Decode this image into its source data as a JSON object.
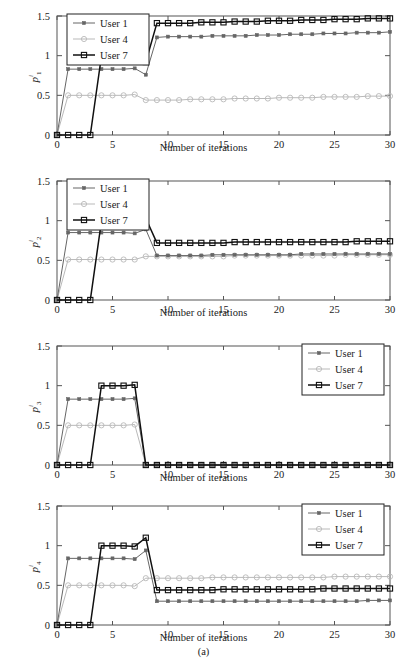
{
  "figure": {
    "caption": "(a)",
    "xlabel": "Number of iterations",
    "legend_labels": [
      "User 1",
      "User 4",
      "User 7"
    ],
    "colors": {
      "user1": "#666666",
      "user4": "#b9b9b9",
      "user7": "#101010",
      "axis": "#555555",
      "background": "#ffffff"
    },
    "markers": {
      "user1": "filled-star",
      "user4": "open-circle",
      "user7": "open-square"
    }
  },
  "chart_data": [
    {
      "type": "line",
      "title": "",
      "panel_id": "p1",
      "ylabel": "p^i_1",
      "ylabel_base": "p",
      "ylabel_sup": "i",
      "ylabel_sub": "1",
      "xlabel": "Number of iterations",
      "xlim": [
        0,
        30
      ],
      "ylim": [
        0,
        1.5
      ],
      "xticks": [
        0,
        5,
        10,
        15,
        20,
        25,
        30
      ],
      "yticks": [
        0,
        0.5,
        1,
        1.5
      ],
      "grid": false,
      "legend_position": "top-left",
      "x": [
        0,
        1,
        2,
        3,
        4,
        5,
        6,
        7,
        8,
        9,
        10,
        11,
        12,
        13,
        14,
        15,
        16,
        17,
        18,
        19,
        20,
        21,
        22,
        23,
        24,
        25,
        26,
        27,
        28,
        29,
        30
      ],
      "series": [
        {
          "name": "User 1",
          "marker": "filled-star",
          "color": "#666666",
          "values": [
            0,
            0.83,
            0.83,
            0.83,
            0.83,
            0.83,
            0.83,
            0.84,
            0.76,
            1.23,
            1.24,
            1.24,
            1.24,
            1.24,
            1.25,
            1.25,
            1.25,
            1.25,
            1.26,
            1.26,
            1.26,
            1.27,
            1.27,
            1.27,
            1.28,
            1.28,
            1.28,
            1.29,
            1.29,
            1.29,
            1.3
          ]
        },
        {
          "name": "User 4",
          "marker": "open-circle",
          "color": "#b9b9b9",
          "values": [
            0,
            0.5,
            0.5,
            0.5,
            0.5,
            0.5,
            0.5,
            0.51,
            0.44,
            0.44,
            0.44,
            0.44,
            0.45,
            0.45,
            0.45,
            0.45,
            0.46,
            0.46,
            0.46,
            0.46,
            0.47,
            0.47,
            0.47,
            0.47,
            0.48,
            0.48,
            0.48,
            0.48,
            0.49,
            0.49,
            0.49
          ]
        },
        {
          "name": "User 7",
          "marker": "open-square",
          "color": "#101010",
          "values": [
            0,
            0,
            0,
            0,
            0.99,
            0.99,
            0.99,
            1.0,
            0.92,
            1.41,
            1.41,
            1.41,
            1.41,
            1.42,
            1.42,
            1.42,
            1.43,
            1.43,
            1.43,
            1.44,
            1.44,
            1.44,
            1.45,
            1.45,
            1.45,
            1.46,
            1.46,
            1.46,
            1.47,
            1.47,
            1.47
          ]
        }
      ]
    },
    {
      "type": "line",
      "title": "",
      "panel_id": "p2",
      "ylabel": "p^i_2",
      "ylabel_base": "p",
      "ylabel_sup": "i",
      "ylabel_sub": "2",
      "xlabel": "Number of iterations",
      "xlim": [
        0,
        30
      ],
      "ylim": [
        0,
        1.5
      ],
      "xticks": [
        0,
        5,
        10,
        15,
        20,
        25,
        30
      ],
      "yticks": [
        0,
        0.5,
        1,
        1.5
      ],
      "grid": false,
      "legend_position": "top-left",
      "x": [
        0,
        1,
        2,
        3,
        4,
        5,
        6,
        7,
        8,
        9,
        10,
        11,
        12,
        13,
        14,
        15,
        16,
        17,
        18,
        19,
        20,
        21,
        22,
        23,
        24,
        25,
        26,
        27,
        28,
        29,
        30
      ],
      "series": [
        {
          "name": "User 1",
          "marker": "filled-star",
          "color": "#666666",
          "values": [
            0,
            0.85,
            0.85,
            0.85,
            0.85,
            0.85,
            0.85,
            0.84,
            0.89,
            0.56,
            0.56,
            0.56,
            0.56,
            0.56,
            0.57,
            0.57,
            0.57,
            0.57,
            0.57,
            0.57,
            0.57,
            0.57,
            0.58,
            0.58,
            0.58,
            0.58,
            0.58,
            0.58,
            0.58,
            0.58,
            0.58
          ]
        },
        {
          "name": "User 4",
          "marker": "open-circle",
          "color": "#b9b9b9",
          "values": [
            0,
            0.51,
            0.51,
            0.51,
            0.51,
            0.51,
            0.51,
            0.51,
            0.55,
            0.55,
            0.55,
            0.55,
            0.55,
            0.55,
            0.55,
            0.55,
            0.56,
            0.56,
            0.56,
            0.56,
            0.56,
            0.56,
            0.56,
            0.56,
            0.56,
            0.56,
            0.57,
            0.57,
            0.57,
            0.57,
            0.57
          ]
        },
        {
          "name": "User 7",
          "marker": "open-square",
          "color": "#101010",
          "values": [
            0,
            0,
            0,
            0,
            0.99,
            0.99,
            0.99,
            0.99,
            1.03,
            0.72,
            0.72,
            0.72,
            0.72,
            0.72,
            0.72,
            0.72,
            0.73,
            0.73,
            0.73,
            0.73,
            0.73,
            0.73,
            0.73,
            0.73,
            0.73,
            0.73,
            0.73,
            0.74,
            0.74,
            0.74,
            0.74
          ]
        }
      ]
    },
    {
      "type": "line",
      "title": "",
      "panel_id": "p3",
      "ylabel": "p^i_3",
      "ylabel_base": "p",
      "ylabel_sup": "i",
      "ylabel_sub": "3",
      "xlabel": "Number of iterations",
      "xlim": [
        0,
        30
      ],
      "ylim": [
        0,
        1.5
      ],
      "xticks": [
        0,
        5,
        10,
        15,
        20,
        25,
        30
      ],
      "yticks": [
        0,
        0.5,
        1,
        1.5
      ],
      "grid": false,
      "legend_position": "top-right",
      "x": [
        0,
        1,
        2,
        3,
        4,
        5,
        6,
        7,
        8,
        9,
        10,
        11,
        12,
        13,
        14,
        15,
        16,
        17,
        18,
        19,
        20,
        21,
        22,
        23,
        24,
        25,
        26,
        27,
        28,
        29,
        30
      ],
      "series": [
        {
          "name": "User 1",
          "marker": "filled-star",
          "color": "#666666",
          "values": [
            0,
            0.83,
            0.83,
            0.83,
            0.83,
            0.83,
            0.83,
            0.84,
            0,
            0,
            0,
            0,
            0,
            0,
            0,
            0,
            0,
            0,
            0,
            0,
            0,
            0,
            0,
            0,
            0,
            0,
            0,
            0,
            0,
            0,
            0
          ]
        },
        {
          "name": "User 4",
          "marker": "open-circle",
          "color": "#b9b9b9",
          "values": [
            0,
            0.5,
            0.5,
            0.5,
            0.5,
            0.5,
            0.5,
            0.51,
            0,
            0,
            0,
            0,
            0,
            0,
            0,
            0,
            0,
            0,
            0,
            0,
            0,
            0,
            0,
            0,
            0,
            0,
            0,
            0,
            0,
            0,
            0
          ]
        },
        {
          "name": "User 7",
          "marker": "open-square",
          "color": "#101010",
          "values": [
            0,
            0,
            0,
            0,
            1.0,
            1.0,
            1.0,
            1.01,
            0,
            0,
            0,
            0,
            0,
            0,
            0,
            0,
            0,
            0,
            0,
            0,
            0,
            0,
            0,
            0,
            0,
            0,
            0,
            0,
            0,
            0,
            0
          ]
        }
      ]
    },
    {
      "type": "line",
      "title": "",
      "panel_id": "p4",
      "ylabel": "p^i_4",
      "ylabel_base": "p",
      "ylabel_sup": "i",
      "ylabel_sub": "4",
      "xlabel": "Number of iterations",
      "xlim": [
        0,
        30
      ],
      "ylim": [
        0,
        1.5
      ],
      "xticks": [
        0,
        5,
        10,
        15,
        20,
        25,
        30
      ],
      "yticks": [
        0,
        0.5,
        1,
        1.5
      ],
      "grid": false,
      "legend_position": "top-right",
      "x": [
        0,
        1,
        2,
        3,
        4,
        5,
        6,
        7,
        8,
        9,
        10,
        11,
        12,
        13,
        14,
        15,
        16,
        17,
        18,
        19,
        20,
        21,
        22,
        23,
        24,
        25,
        26,
        27,
        28,
        29,
        30
      ],
      "series": [
        {
          "name": "User 1",
          "marker": "filled-star",
          "color": "#666666",
          "values": [
            0,
            0.84,
            0.84,
            0.84,
            0.84,
            0.84,
            0.84,
            0.83,
            0.94,
            0.3,
            0.3,
            0.3,
            0.3,
            0.3,
            0.3,
            0.3,
            0.3,
            0.3,
            0.3,
            0.3,
            0.3,
            0.3,
            0.3,
            0.3,
            0.3,
            0.3,
            0.3,
            0.3,
            0.31,
            0.31,
            0.31
          ]
        },
        {
          "name": "User 4",
          "marker": "open-circle",
          "color": "#b9b9b9",
          "values": [
            0,
            0.5,
            0.5,
            0.5,
            0.5,
            0.5,
            0.5,
            0.49,
            0.59,
            0.59,
            0.59,
            0.59,
            0.59,
            0.59,
            0.6,
            0.6,
            0.6,
            0.6,
            0.6,
            0.6,
            0.6,
            0.6,
            0.6,
            0.6,
            0.6,
            0.61,
            0.61,
            0.61,
            0.61,
            0.61,
            0.61
          ]
        },
        {
          "name": "User 7",
          "marker": "open-square",
          "color": "#101010",
          "values": [
            0,
            0,
            0,
            0,
            1.0,
            1.0,
            1.0,
            0.99,
            1.1,
            0.44,
            0.44,
            0.44,
            0.44,
            0.44,
            0.44,
            0.45,
            0.45,
            0.45,
            0.45,
            0.45,
            0.45,
            0.45,
            0.45,
            0.45,
            0.46,
            0.46,
            0.46,
            0.46,
            0.46,
            0.46,
            0.46
          ]
        }
      ]
    }
  ]
}
